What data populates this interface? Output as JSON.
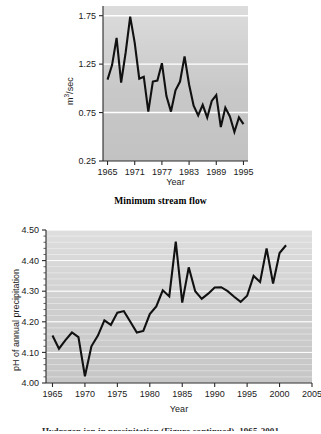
{
  "figure": {
    "background": "#ffffff",
    "line_color": "#111111",
    "plot_bg_top": "#c9c9c9",
    "plot_bg_bottom": "#cfcfcf",
    "gridline_color": "#ffffff"
  },
  "chart_data": [
    {
      "id": "stream-flow",
      "type": "line",
      "title": "Minimum stream flow",
      "xlabel": "Year",
      "ylabel": "m³/sec",
      "xlim": [
        1964,
        1996
      ],
      "ylim": [
        0.25,
        1.85
      ],
      "xticks": [
        1965,
        1971,
        1977,
        1983,
        1989,
        1995
      ],
      "xticklabels": [
        "1965",
        "1971",
        "1977",
        "1983",
        "1989",
        "1995"
      ],
      "yticks": [
        0.25,
        0.75,
        1.25,
        1.75
      ],
      "yticklabels": [
        "0.25",
        "0.75",
        "1.25",
        "1.75"
      ],
      "grid": "horizontal-major",
      "legend": "none",
      "x": [
        1965,
        1966,
        1967,
        1968,
        1969,
        1970,
        1971,
        1972,
        1973,
        1974,
        1975,
        1976,
        1977,
        1978,
        1979,
        1980,
        1981,
        1982,
        1983,
        1984,
        1985,
        1986,
        1987,
        1988,
        1989,
        1990,
        1991,
        1992,
        1993,
        1994,
        1995
      ],
      "values": [
        1.09,
        1.24,
        1.52,
        1.06,
        1.37,
        1.74,
        1.47,
        1.1,
        1.12,
        0.76,
        1.07,
        1.08,
        1.26,
        0.92,
        0.76,
        0.98,
        1.07,
        1.33,
        1.04,
        0.82,
        0.72,
        0.83,
        0.7,
        0.87,
        0.93,
        0.6,
        0.8,
        0.71,
        0.55,
        0.7,
        0.63
      ]
    },
    {
      "id": "ph-precipitation",
      "type": "line",
      "title": "",
      "xlabel": "Year",
      "ylabel": "pH of annual precipitation",
      "xlim": [
        1964,
        2005
      ],
      "ylim": [
        4.0,
        4.5
      ],
      "xticks": [
        1965,
        1970,
        1975,
        1980,
        1985,
        1990,
        1995,
        2000,
        2005
      ],
      "xticklabels": [
        "1965",
        "1970",
        "1975",
        "1980",
        "1985",
        "1990",
        "1995",
        "2000",
        "2005"
      ],
      "yticks": [
        4.0,
        4.1,
        4.2,
        4.3,
        4.4,
        4.5
      ],
      "yticklabels": [
        "4.00",
        "4.10",
        "4.20",
        "4.30",
        "4.40",
        "4.50"
      ],
      "minor_ytick_step": 0.02,
      "grid": "horizontal-minor",
      "legend": "none",
      "x": [
        1965,
        1966,
        1967,
        1968,
        1969,
        1970,
        1971,
        1972,
        1973,
        1974,
        1975,
        1976,
        1977,
        1978,
        1979,
        1980,
        1981,
        1982,
        1983,
        1984,
        1985,
        1986,
        1987,
        1988,
        1989,
        1990,
        1991,
        1992,
        1993,
        1994,
        1995,
        1996,
        1997,
        1998,
        1999,
        2000,
        2001
      ],
      "values": [
        4.155,
        4.112,
        4.14,
        4.165,
        4.15,
        4.022,
        4.12,
        4.155,
        4.205,
        4.19,
        4.23,
        4.235,
        4.2,
        4.165,
        4.17,
        4.225,
        4.25,
        4.303,
        4.283,
        4.462,
        4.263,
        4.378,
        4.3,
        4.275,
        4.292,
        4.312,
        4.313,
        4.3,
        4.282,
        4.265,
        4.285,
        4.35,
        4.33,
        4.44,
        4.325,
        4.425,
        4.45
      ]
    }
  ],
  "panels": {
    "top": {
      "caption": "Minimum stream flow",
      "xlabel": "Year",
      "ylabel": "m³/sec"
    },
    "bottom": {
      "xlabel": "Year",
      "ylabel": "pH of annual precipitation",
      "caption_partial": "Hydrogen ion in precipitation (Figure continued), 1965-2001"
    }
  }
}
